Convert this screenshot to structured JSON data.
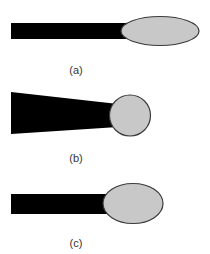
{
  "colors": {
    "background": "#ffffff",
    "stem": "#000000",
    "head_fill": "#c8c8c8",
    "head_stroke": "#3a3a3a",
    "label": "#333333"
  },
  "panels": [
    {
      "id": "a",
      "label": "(a)",
      "stem_shape": "rectangle",
      "head_shape": "ellipse"
    },
    {
      "id": "b",
      "label": "(b)",
      "stem_shape": "tapered-trapezoid",
      "head_shape": "circle"
    },
    {
      "id": "c",
      "label": "(c)",
      "stem_shape": "rectangle",
      "head_shape": "ellipse"
    }
  ]
}
